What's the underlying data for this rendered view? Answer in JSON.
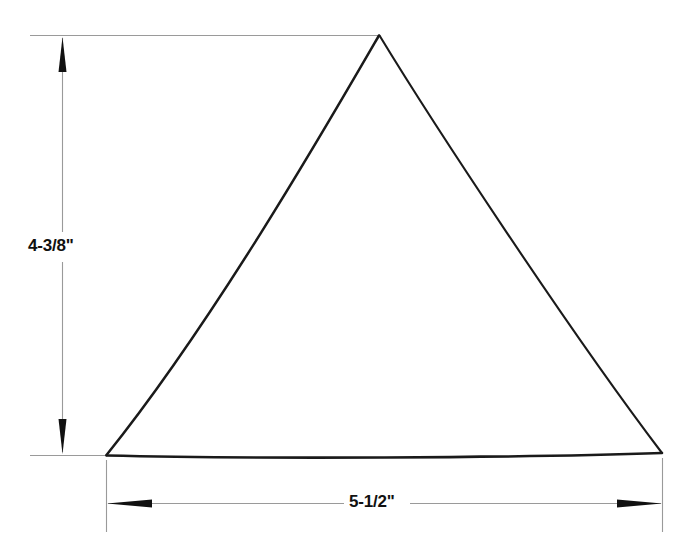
{
  "drawing": {
    "type": "technical-dimension-drawing",
    "background_color": "#ffffff",
    "line_color": "#1a1a1a",
    "extension_line_color": "#8a8a8a",
    "shape": {
      "name": "triangle",
      "description": "isosceles triangle with slightly concave sides",
      "vertices": {
        "apex": [
          379,
          35
        ],
        "bottom_left": [
          106,
          455
        ],
        "bottom_right": [
          662,
          453
        ]
      }
    },
    "dimensions": {
      "height": {
        "label": "4-3/8\"",
        "orientation": "vertical",
        "value": 4.375,
        "unit": "inch"
      },
      "width": {
        "label": "5-1/2\"",
        "orientation": "horizontal",
        "value": 5.5,
        "unit": "inch"
      }
    }
  }
}
